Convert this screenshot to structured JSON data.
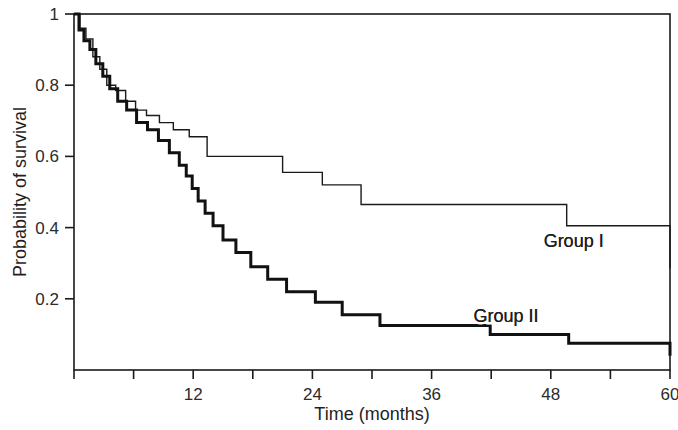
{
  "chart_data": {
    "type": "line",
    "title": "",
    "subtitle": "",
    "xlabel": "Time (months)",
    "ylabel": "Probability of survival",
    "xlim": [
      0,
      60
    ],
    "ylim": [
      0,
      1
    ],
    "grid": false,
    "legend_position": "inline-right",
    "step_style": "post",
    "x_ticks": [
      0,
      6,
      12,
      18,
      24,
      30,
      36,
      42,
      48,
      54,
      60
    ],
    "x_tick_labels": [
      "",
      "",
      "12",
      "",
      "24",
      "",
      "36",
      "",
      "48",
      "",
      "60"
    ],
    "y_ticks": [
      0.2,
      0.4,
      0.6,
      0.8,
      1
    ],
    "y_tick_labels": [
      "0.2",
      "0.4",
      "0.6",
      "0.8",
      "1"
    ],
    "series": [
      {
        "name": "Group I",
        "line_width": 1.4,
        "color": "#1a1a1a",
        "label_x": 50.3,
        "label_y": 0.345,
        "x": [
          0,
          0.6,
          1.2,
          1.9,
          2.6,
          3.3,
          4.2,
          5.2,
          6.2,
          7.3,
          8.6,
          10.0,
          11.6,
          13.4,
          14.6,
          17.4,
          21.0,
          25.0,
          28.9,
          49.6,
          60
        ],
        "y": [
          1.0,
          0.96,
          0.93,
          0.88,
          0.845,
          0.8,
          0.785,
          0.755,
          0.73,
          0.715,
          0.695,
          0.675,
          0.655,
          0.6,
          0.6,
          0.6,
          0.555,
          0.52,
          0.465,
          0.405,
          0.285
        ]
      },
      {
        "name": "Group II",
        "line_width": 3.0,
        "color": "#111111",
        "label_x": 43.5,
        "label_y": 0.135,
        "x": [
          0,
          0.5,
          1.0,
          1.6,
          2.2,
          2.9,
          3.6,
          4.4,
          5.3,
          6.3,
          7.4,
          8.5,
          9.6,
          10.6,
          11.3,
          11.9,
          12.5,
          13.2,
          14.0,
          15.0,
          16.3,
          17.8,
          19.5,
          21.4,
          24.3,
          27.0,
          30.8,
          41.9,
          49.8,
          60
        ],
        "y": [
          1.0,
          0.955,
          0.925,
          0.9,
          0.86,
          0.825,
          0.79,
          0.755,
          0.73,
          0.695,
          0.675,
          0.645,
          0.61,
          0.575,
          0.545,
          0.51,
          0.475,
          0.44,
          0.405,
          0.365,
          0.33,
          0.29,
          0.255,
          0.22,
          0.19,
          0.155,
          0.125,
          0.1,
          0.075,
          0.04
        ]
      }
    ]
  },
  "figure": {
    "background_color": "#ffffff",
    "axis_color": "#1a1a1a",
    "frame": true
  }
}
